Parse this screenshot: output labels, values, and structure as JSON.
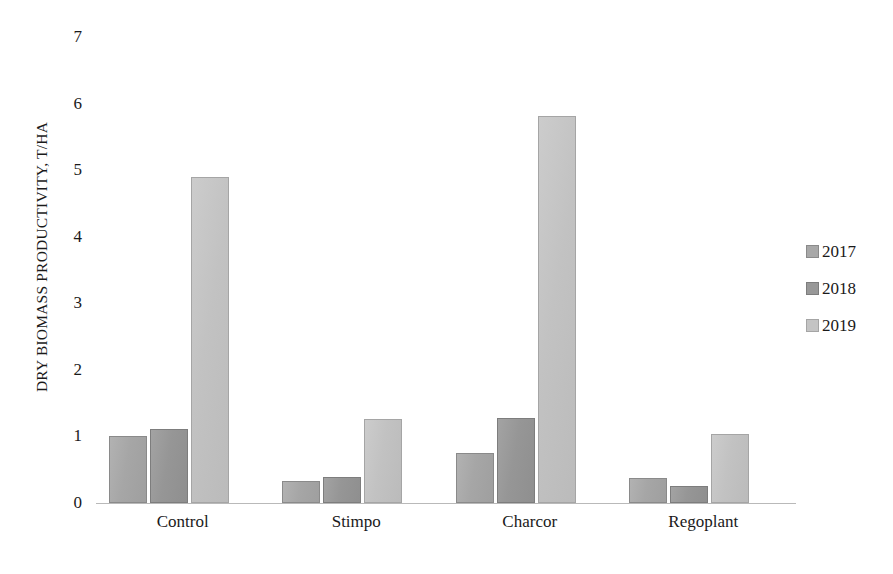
{
  "chart_data": {
    "type": "bar",
    "title": "",
    "xlabel": "",
    "ylabel": "DRY BIOMASS PRODUCTIVITY, T/HA",
    "categories": [
      "Control",
      "Stimpo",
      "Charcor",
      "Regoplant"
    ],
    "series": [
      {
        "name": "2017",
        "color": "#a8a8a8",
        "values": [
          1.0,
          0.33,
          0.75,
          0.37
        ]
      },
      {
        "name": "2018",
        "color": "#989898",
        "values": [
          1.11,
          0.39,
          1.27,
          0.25
        ]
      },
      {
        "name": "2019",
        "color": "#c4c4c4",
        "values": [
          4.89,
          1.26,
          5.81,
          1.04
        ]
      }
    ],
    "ylim": [
      0,
      7
    ],
    "yticks": [
      0,
      1,
      2,
      3,
      4,
      5,
      6,
      7
    ],
    "ytick_labels": [
      "0",
      "1",
      "2",
      "3",
      "4",
      "5",
      "6",
      "7"
    ],
    "grid": false,
    "legend_position": "right"
  },
  "legend": {
    "entries": [
      {
        "label": "2017"
      },
      {
        "label": "2018"
      },
      {
        "label": "2019"
      }
    ]
  }
}
